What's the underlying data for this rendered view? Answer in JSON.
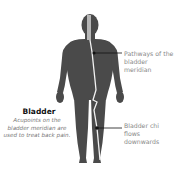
{
  "diagram": {
    "title": "Bladder",
    "description": "Acupoints on the bladder meridian are used to treat back pain.",
    "callouts": [
      {
        "text": "Pathways of the bladder meridian",
        "target": "upper back meridian line"
      },
      {
        "text": "Bladder chi flows downwards",
        "target": "lower leg meridian point"
      }
    ],
    "colors": {
      "body": "#4a4a4a",
      "meridian": "#f2f2f2",
      "leader_line": "#111111",
      "label_text": "#888888"
    }
  }
}
